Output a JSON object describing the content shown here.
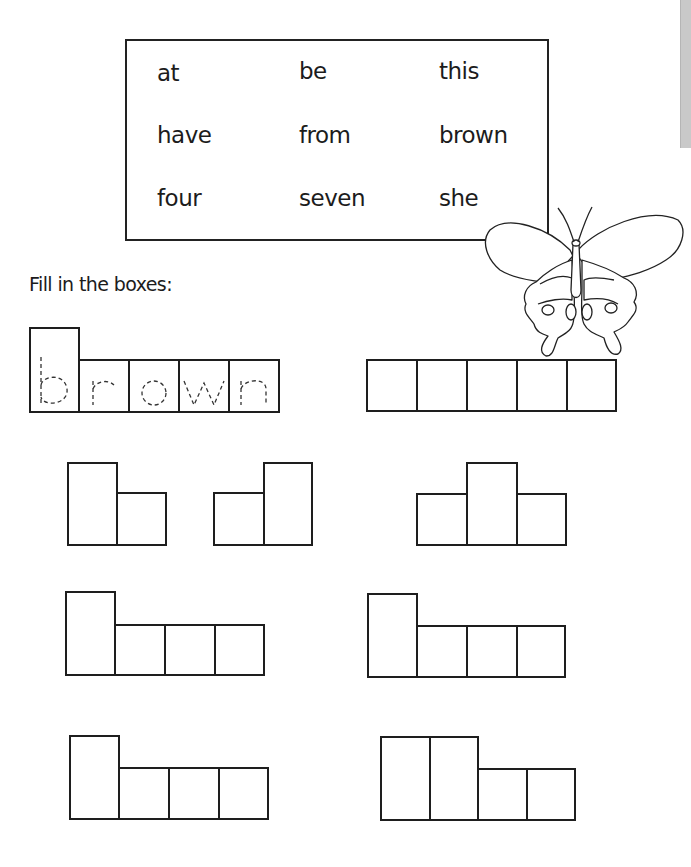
{
  "page": {
    "side_tab_color": "#c9c9c9"
  },
  "word_bank": {
    "words": [
      "at",
      "be",
      "this",
      "have",
      "from",
      "brown",
      "four",
      "seven",
      "she"
    ]
  },
  "instruction": "Fill in the boxes:",
  "example": {
    "word": "brown",
    "letters": [
      "b",
      "r",
      "o",
      "w",
      "n"
    ],
    "style": "dashed-tracing"
  },
  "puzzles": [
    {
      "id": "row1-right",
      "pattern": [
        "short",
        "short",
        "short",
        "short",
        "short"
      ]
    },
    {
      "id": "row2-left-a",
      "pattern": [
        "tall",
        "short"
      ]
    },
    {
      "id": "row2-left-b",
      "pattern": [
        "short",
        "tall"
      ]
    },
    {
      "id": "row2-right",
      "pattern": [
        "short",
        "tall",
        "short"
      ]
    },
    {
      "id": "row3-left",
      "pattern": [
        "tall",
        "short",
        "short",
        "short"
      ]
    },
    {
      "id": "row3-right",
      "pattern": [
        "tall",
        "short",
        "short",
        "short"
      ]
    },
    {
      "id": "row4-left",
      "pattern": [
        "tall",
        "short",
        "short",
        "short"
      ]
    },
    {
      "id": "row4-right",
      "pattern": [
        "tall",
        "tall",
        "short",
        "short"
      ]
    }
  ],
  "illustration": {
    "icon": "butterfly-icon"
  }
}
